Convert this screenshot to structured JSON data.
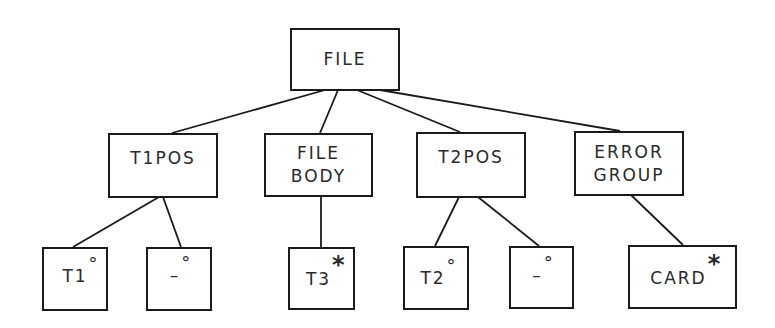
{
  "diagram": {
    "type": "tree",
    "root": {
      "id": "file",
      "lines": [
        "FILE"
      ]
    },
    "level1": [
      {
        "id": "t1pos",
        "lines": [
          "T1POS"
        ]
      },
      {
        "id": "file-body",
        "lines": [
          "FILE",
          "BODY"
        ]
      },
      {
        "id": "t2pos",
        "lines": [
          "T2POS"
        ]
      },
      {
        "id": "error-group",
        "lines": [
          "ERROR",
          "GROUP"
        ]
      }
    ],
    "level2": [
      {
        "id": "t1",
        "label": "T1",
        "mark": "°",
        "parent": "t1pos"
      },
      {
        "id": "t1pos-null",
        "label": "–",
        "mark": "°",
        "parent": "t1pos"
      },
      {
        "id": "t3",
        "label": "T3",
        "mark": "*",
        "parent": "file-body"
      },
      {
        "id": "t2",
        "label": "T2",
        "mark": "°",
        "parent": "t2pos"
      },
      {
        "id": "t2pos-null",
        "label": "–",
        "mark": "°",
        "parent": "t2pos"
      },
      {
        "id": "card",
        "label": "CARD",
        "mark": "*",
        "parent": "error-group"
      }
    ],
    "edges": [
      [
        "file",
        "t1pos"
      ],
      [
        "file",
        "file-body"
      ],
      [
        "file",
        "t2pos"
      ],
      [
        "file",
        "error-group"
      ],
      [
        "t1pos",
        "t1"
      ],
      [
        "t1pos",
        "t1pos-null"
      ],
      [
        "file-body",
        "t3"
      ],
      [
        "t2pos",
        "t2"
      ],
      [
        "t2pos",
        "t2pos-null"
      ],
      [
        "error-group",
        "card"
      ]
    ],
    "colors": {
      "line": "#1a1a1a",
      "text": "#2a2a2a",
      "background": "#ffffff"
    }
  }
}
